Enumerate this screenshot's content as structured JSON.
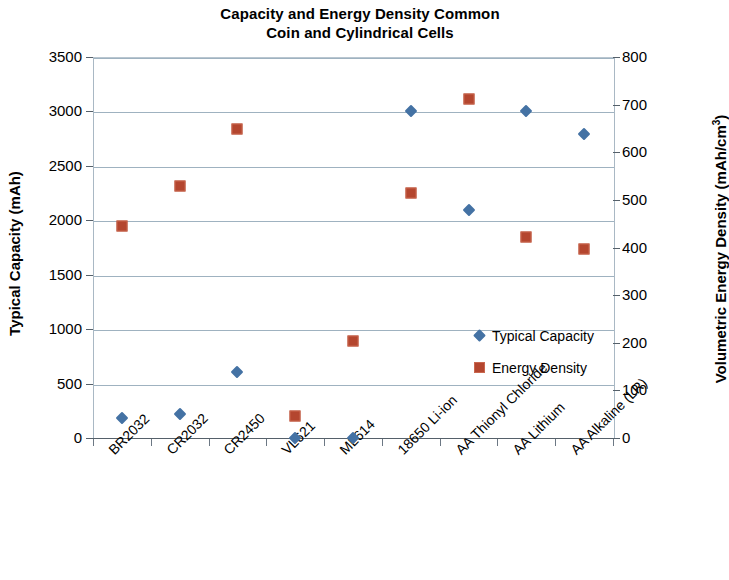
{
  "chart_data": {
    "type": "scatter",
    "title": "Capacity and Energy Density Common Coin and Cylindrical Cells",
    "title_line1": "Capacity and Energy Density Common",
    "title_line2": "Coin and Cylindrical Cells",
    "xlabel": "",
    "ylabel": "Typical Capacity (mAh)",
    "y2label": "Volumetric Energy Density (mAh/cm³)",
    "y2label_base": "Volumetric Energy Density (mAh/cm",
    "y2label_sup": "3",
    "y2label_close": ")",
    "grid": true,
    "legend_position": "inside-right",
    "categories": [
      "BR2032",
      "CR2032",
      "CR2450",
      "VL621",
      "ML614",
      "18650 Li-ion",
      "AA Thionyl Chloride",
      "AA Lithium",
      "AA Alkaline (LR)"
    ],
    "ylim": [
      0,
      3500
    ],
    "yticks": [
      0,
      500,
      1000,
      1500,
      2000,
      2500,
      3000,
      3500
    ],
    "y2lim": [
      0,
      800
    ],
    "y2ticks": [
      0,
      100,
      200,
      300,
      400,
      500,
      600,
      700,
      800
    ],
    "series": [
      {
        "name": "Typical Capacity",
        "axis": "left",
        "marker": "diamond",
        "color": "#4472a4",
        "values": [
          180,
          220,
          610,
          0,
          0,
          3000,
          2090,
          3000,
          2790
        ]
      },
      {
        "name": "Energy Density",
        "axis": "right",
        "marker": "square",
        "color": "#b4462f",
        "values": [
          445,
          530,
          648,
          47,
          203,
          514,
          711,
          423,
          397
        ]
      }
    ]
  },
  "legend": {
    "entries": [
      {
        "label": "Typical Capacity",
        "marker": "diamond",
        "color": "#4472a4"
      },
      {
        "label": "Energy Density",
        "marker": "square",
        "color": "#b4462f"
      }
    ]
  }
}
